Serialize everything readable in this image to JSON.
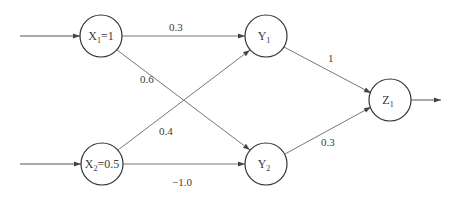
{
  "diagram": {
    "type": "neural-network",
    "colors": {
      "stroke": "#555555",
      "text": "#3a3a3a",
      "background": "#ffffff"
    },
    "nodes": [
      {
        "id": "X1",
        "base": "X",
        "sub": "1",
        "suffix": "=1",
        "cx": 101,
        "cy": 36
      },
      {
        "id": "X2",
        "base": "X",
        "sub": "2",
        "suffix": "=0.5",
        "cx": 102,
        "cy": 164
      },
      {
        "id": "Y1",
        "base": "Y",
        "sub": "1",
        "suffix": "",
        "cx": 266,
        "cy": 36
      },
      {
        "id": "Y2",
        "base": "Y",
        "sub": "2",
        "suffix": "",
        "cx": 266,
        "cy": 164
      },
      {
        "id": "Z1",
        "base": "Z",
        "sub": "1",
        "suffix": "",
        "cx": 390,
        "cy": 100
      }
    ],
    "edges": [
      {
        "from": "X1",
        "to": "Y1",
        "weight": "0.3"
      },
      {
        "from": "X1",
        "to": "Y2",
        "weight": "0.6"
      },
      {
        "from": "X2",
        "to": "Y1",
        "weight": "0.4"
      },
      {
        "from": "X2",
        "to": "Y2",
        "weight": "−1.0"
      },
      {
        "from": "Y1",
        "to": "Z1",
        "weight": "1"
      },
      {
        "from": "Y2",
        "to": "Z1",
        "weight": "0.3"
      }
    ],
    "inputs": [
      {
        "to": "X1"
      },
      {
        "to": "X2"
      }
    ],
    "outputs": [
      {
        "from": "Z1"
      }
    ]
  }
}
